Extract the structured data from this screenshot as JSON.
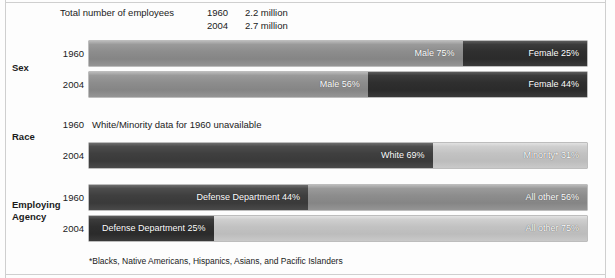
{
  "figure": {
    "background_color": "#fdfdfd",
    "frame_color": "#cfcfcf"
  },
  "header": {
    "title_label": "Total number of employees",
    "rows": [
      {
        "year": "1960",
        "value": "2.2 million"
      },
      {
        "year": "2004",
        "value": "2.7 million"
      }
    ]
  },
  "groups": [
    {
      "id": "sex",
      "label": "Sex"
    },
    {
      "id": "race",
      "label": "Race"
    },
    {
      "id": "agency",
      "label": "Employing\nAgency"
    }
  ],
  "rows": [
    {
      "group": "sex",
      "year": "1960",
      "segments": [
        {
          "label": "Male  75%",
          "percent": 75,
          "tone": "mid",
          "align": "right"
        },
        {
          "label": "Female 25%",
          "percent": 25,
          "tone": "darkest",
          "align": "right"
        }
      ]
    },
    {
      "group": "sex",
      "year": "2004",
      "segments": [
        {
          "label": "Male  56%",
          "percent": 56,
          "tone": "mid",
          "align": "right"
        },
        {
          "label": "Female 44%",
          "percent": 44,
          "tone": "darkest",
          "align": "right"
        }
      ]
    },
    {
      "group": "race",
      "year": "1960",
      "note": "White/Minority data for 1960 unavailable",
      "segments": []
    },
    {
      "group": "race",
      "year": "2004",
      "segments": [
        {
          "label": "White  69%",
          "percent": 69,
          "tone": "dark",
          "align": "right"
        },
        {
          "label": "Minority*  31%",
          "percent": 31,
          "tone": "light",
          "align": "right"
        }
      ]
    },
    {
      "group": "agency",
      "year": "1960",
      "segments": [
        {
          "label": "Defense Department  44%",
          "percent": 44,
          "tone": "dark",
          "align": "right"
        },
        {
          "label": "All other  56%",
          "percent": 56,
          "tone": "mid",
          "align": "right"
        }
      ]
    },
    {
      "group": "agency",
      "year": "2004",
      "segments": [
        {
          "label": "Defense Department  25%",
          "percent": 25,
          "tone": "darkest",
          "align": "right"
        },
        {
          "label": "All other  75%",
          "percent": 75,
          "tone": "light",
          "align": "right"
        }
      ]
    }
  ],
  "footnote": "*Blacks, Native Americans, Hispanics, Asians, and Pacific Islanders",
  "chart_data": {
    "type": "bar",
    "title": "Total number of employees",
    "subtitle": "",
    "xlabel": "",
    "ylabel": "",
    "xlim": [
      0,
      100
    ],
    "grid": false,
    "legend": "inline-data-labels",
    "orientation": "horizontal-stacked-100pct",
    "units": "percent of total employees",
    "totals": [
      {
        "year": "1960",
        "employees": "2.2 million"
      },
      {
        "year": "2004",
        "employees": "2.7 million"
      }
    ],
    "groups": [
      {
        "name": "Sex",
        "categories": [
          "1960",
          "2004"
        ],
        "series": [
          {
            "name": "Male",
            "values": [
              75,
              56
            ]
          },
          {
            "name": "Female",
            "values": [
              25,
              44
            ]
          }
        ]
      },
      {
        "name": "Race",
        "categories": [
          "1960",
          "2004"
        ],
        "note_1960": "White/Minority data for 1960 unavailable",
        "series": [
          {
            "name": "White",
            "values": [
              null,
              69
            ]
          },
          {
            "name": "Minority*",
            "values": [
              null,
              31
            ]
          }
        ]
      },
      {
        "name": "Employing Agency",
        "categories": [
          "1960",
          "2004"
        ],
        "series": [
          {
            "name": "Defense Department",
            "values": [
              44,
              25
            ]
          },
          {
            "name": "All other",
            "values": [
              56,
              75
            ]
          }
        ]
      }
    ],
    "annotations": [
      "*Blacks, Native Americans, Hispanics, Asians, and Pacific Islanders"
    ]
  }
}
